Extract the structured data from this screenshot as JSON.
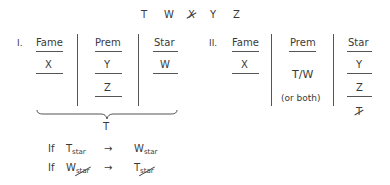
{
  "header": {
    "letters": [
      {
        "label": "T",
        "crossed": false
      },
      {
        "label": "W",
        "crossed": false
      },
      {
        "label": "X",
        "crossed": true
      },
      {
        "label": "Y",
        "crossed": false
      },
      {
        "label": "Z",
        "crossed": false
      }
    ]
  },
  "section1": {
    "numeral": "I.",
    "columns": [
      {
        "heading": "Fame",
        "entries": [
          "X"
        ]
      },
      {
        "heading": "Prem",
        "entries": [
          "Y",
          "Z"
        ]
      },
      {
        "heading": "Star",
        "entries": [
          "W"
        ]
      }
    ],
    "brace_label": "T",
    "rules": [
      {
        "if": "If",
        "lhs": "T",
        "lhs_sub": "star",
        "lhs_sub_crossed": false,
        "arrow": "→",
        "rhs": "W",
        "rhs_sub": "star",
        "rhs_sub_crossed": false
      },
      {
        "if": "If",
        "lhs": "W",
        "lhs_sub": "star",
        "lhs_sub_crossed": true,
        "arrow": "→",
        "rhs": "T",
        "rhs_sub": "star",
        "rhs_sub_crossed": true
      }
    ]
  },
  "section2": {
    "numeral": "II.",
    "columns": [
      {
        "heading": "Fame",
        "entries": [
          "X"
        ]
      },
      {
        "heading": "Prem",
        "entries": [
          "T/W",
          "(or both)"
        ]
      },
      {
        "heading": "Star",
        "entries": [
          "Y",
          "Z",
          "T"
        ],
        "crossed_last": true
      }
    ]
  }
}
